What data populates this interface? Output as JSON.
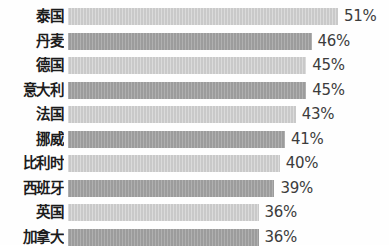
{
  "chart_data": {
    "type": "bar",
    "orientation": "horizontal",
    "title": "",
    "subtitle": "",
    "xlabel": "",
    "ylabel": "",
    "grid": false,
    "legend": "none",
    "xlim": [
      0,
      51
    ],
    "value_suffix": "%",
    "categories": [
      "泰国",
      "丹麦",
      "德国",
      "意大利",
      "法国",
      "挪威",
      "比利时",
      "西班牙",
      "英国",
      "加拿大"
    ],
    "values": [
      51,
      46,
      45,
      45,
      43,
      41,
      40,
      39,
      36,
      36
    ],
    "value_labels": [
      "51%",
      "46%",
      "45%",
      "45%",
      "43%",
      "41%",
      "40%",
      "39%",
      "36%",
      "36%"
    ],
    "bar_colors": [
      "#c9c9c9",
      "#9c9c9c",
      "#c9c9c9",
      "#9c9c9c",
      "#c9c9c9",
      "#9c9c9c",
      "#c9c9c9",
      "#9c9c9c",
      "#c9c9c9",
      "#9c9c9c"
    ],
    "background_color": "#fefefe",
    "label_color": "#1c1c1c",
    "value_color": "#3c3c3c"
  }
}
